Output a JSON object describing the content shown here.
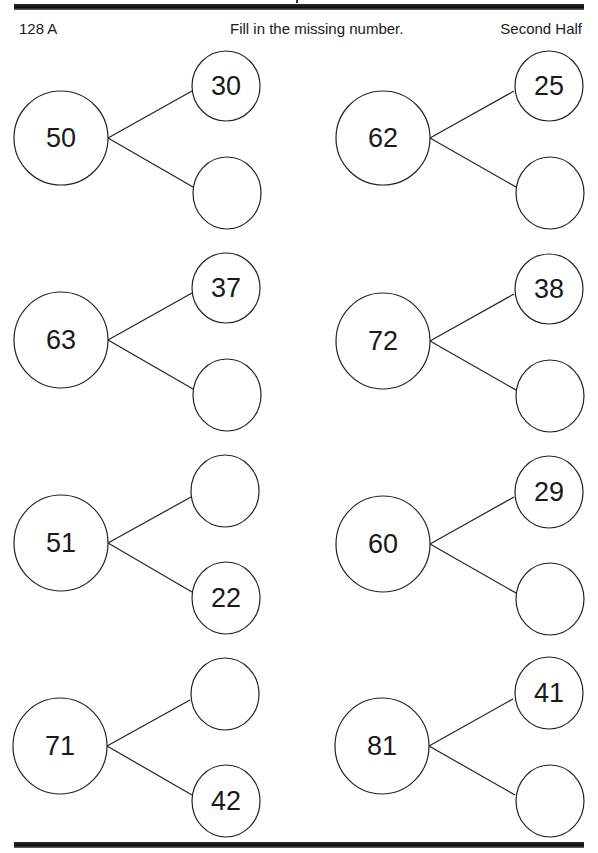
{
  "header": {
    "left": "128 A",
    "center": "Fill in the missing number.",
    "right": "Second Half"
  },
  "colors": {
    "ink": "#1a1a1a",
    "rule": "#111111",
    "background": "#ffffff"
  },
  "problems": [
    {
      "whole": "50",
      "top": "30",
      "bottom": ""
    },
    {
      "whole": "62",
      "top": "25",
      "bottom": ""
    },
    {
      "whole": "63",
      "top": "37",
      "bottom": ""
    },
    {
      "whole": "72",
      "top": "38",
      "bottom": ""
    },
    {
      "whole": "51",
      "top": "",
      "bottom": "22"
    },
    {
      "whole": "60",
      "top": "29",
      "bottom": ""
    },
    {
      "whole": "71",
      "top": "",
      "bottom": "42"
    },
    {
      "whole": "81",
      "top": "41",
      "bottom": ""
    }
  ]
}
